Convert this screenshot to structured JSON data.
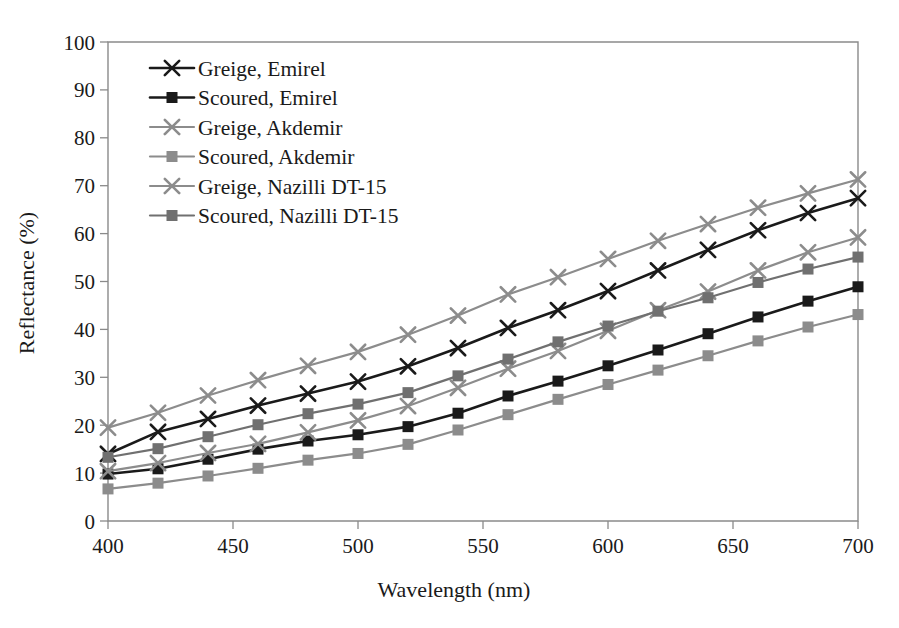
{
  "chart_data": {
    "type": "line",
    "title": "",
    "xlabel": "Wavelength (nm)",
    "ylabel": "Reflectance (%)",
    "xlim": [
      400,
      700
    ],
    "ylim": [
      0,
      100
    ],
    "xticks": [
      400,
      450,
      500,
      550,
      600,
      650,
      700
    ],
    "yticks": [
      0,
      10,
      20,
      30,
      40,
      50,
      60,
      70,
      80,
      90,
      100
    ],
    "grid": false,
    "legend_position": "upper-left",
    "x": [
      400,
      420,
      440,
      460,
      480,
      500,
      520,
      540,
      560,
      580,
      600,
      620,
      640,
      660,
      680,
      700
    ],
    "series": [
      {
        "name": "Greige, Emirel",
        "marker": "x",
        "color": "#1a1a1a",
        "values": [
          14.0,
          18.6,
          21.3,
          24.1,
          26.6,
          29.1,
          32.3,
          36.1,
          40.3,
          44.0,
          48.0,
          52.3,
          56.6,
          60.7,
          64.3,
          67.4
        ]
      },
      {
        "name": "Scoured, Emirel",
        "marker": "square",
        "color": "#1a1a1a",
        "values": [
          9.8,
          10.9,
          12.9,
          15.0,
          16.7,
          18.0,
          19.7,
          22.5,
          26.1,
          29.2,
          32.4,
          35.7,
          39.1,
          42.6,
          45.9,
          48.9
        ]
      },
      {
        "name": "Greige, Akdemir",
        "marker": "x",
        "color": "#8c8c8c",
        "values": [
          10.4,
          12.1,
          14.2,
          16.1,
          18.5,
          21.0,
          24.0,
          27.8,
          31.8,
          35.5,
          39.7,
          44.0,
          47.9,
          52.3,
          56.1,
          59.2
        ]
      },
      {
        "name": "Scoured, Akdemir",
        "marker": "square",
        "color": "#8c8c8c",
        "values": [
          6.7,
          7.9,
          9.4,
          11.0,
          12.7,
          14.1,
          16.0,
          19.0,
          22.2,
          25.4,
          28.5,
          31.5,
          34.5,
          37.6,
          40.5,
          43.1
        ]
      },
      {
        "name": "Greige, Nazilli DT-15",
        "marker": "x",
        "color": "#8c8c8c",
        "values": [
          19.5,
          22.6,
          26.2,
          29.4,
          32.4,
          35.3,
          38.9,
          42.9,
          47.3,
          50.9,
          54.7,
          58.5,
          62.0,
          65.4,
          68.4,
          71.3
        ]
      },
      {
        "name": "Scoured, Nazilli DT-15",
        "marker": "square",
        "color": "#707070",
        "values": [
          13.3,
          15.1,
          17.6,
          20.1,
          22.4,
          24.4,
          26.8,
          30.3,
          33.8,
          37.4,
          40.7,
          43.8,
          46.6,
          49.8,
          52.6,
          55.1
        ]
      }
    ]
  },
  "legend": {
    "items": [
      {
        "label": "Greige, Emirel"
      },
      {
        "label": "Scoured, Emirel"
      },
      {
        "label": "Greige, Akdemir"
      },
      {
        "label": "Scoured, Akdemir"
      },
      {
        "label": "Greige, Nazilli DT-15"
      },
      {
        "label": "Scoured, Nazilli DT-15"
      }
    ]
  },
  "axes": {
    "x_title": "Wavelength (nm)",
    "y_title": "Reflectance (%)",
    "x_tick_labels": [
      "400",
      "450",
      "500",
      "550",
      "600",
      "650",
      "700"
    ],
    "y_tick_labels": [
      "0",
      "10",
      "20",
      "30",
      "40",
      "50",
      "60",
      "70",
      "80",
      "90",
      "100"
    ]
  },
  "colors": {
    "black_series": "#1a1a1a",
    "gray_series": "#8c8c8c",
    "mid_gray_series": "#707070",
    "axis": "#8a8a8a",
    "background": "#ffffff"
  }
}
